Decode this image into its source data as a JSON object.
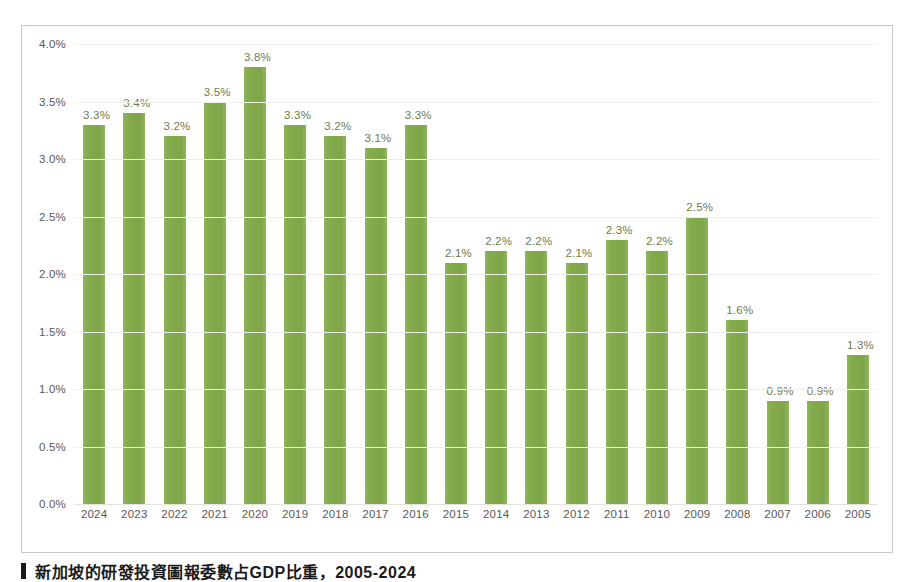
{
  "caption": {
    "bullet": "square-bullet-icon",
    "text": "新加坡的研發投資圖報委數占GDP比重，2005-2024"
  },
  "colors": {
    "bar": "#83ac4b",
    "bar_label": "#6f7a4d",
    "axis_text": "#585858",
    "frame": "#c9c9c9",
    "gridline": "#f0efe9"
  },
  "chart_data": {
    "type": "bar",
    "title": "",
    "xlabel": "",
    "ylabel": "",
    "ylim": [
      0,
      4.0
    ],
    "y_ticks": [
      "0.0%",
      "0.5%",
      "1.0%",
      "1.5%",
      "2.0%",
      "2.5%",
      "3.0%",
      "3.5%",
      "4.0%"
    ],
    "y_tick_values": [
      0,
      0.5,
      1.0,
      1.5,
      2.0,
      2.5,
      3.0,
      3.5,
      4.0
    ],
    "grid": true,
    "legend": "none",
    "categories": [
      "2024",
      "2023",
      "2022",
      "2021",
      "2020",
      "2019",
      "2018",
      "2017",
      "2016",
      "2015",
      "2014",
      "2013",
      "2012",
      "2011",
      "2010",
      "2009",
      "2008",
      "2007",
      "2006",
      "2005"
    ],
    "values": [
      3.3,
      3.4,
      3.2,
      3.5,
      3.8,
      3.3,
      3.2,
      3.1,
      3.3,
      2.1,
      2.2,
      2.2,
      2.1,
      2.3,
      2.2,
      2.5,
      1.6,
      0.9,
      0.9,
      1.3
    ],
    "data_labels": [
      "3.3%",
      "3.4%",
      "3.2%",
      "3.5%",
      "3.8%",
      "3.3%",
      "3.2%",
      "3.1%",
      "3.3%",
      "2.1%",
      "2.2%",
      "2.2%",
      "2.1%",
      "2.3%",
      "2.2%",
      "2.5%",
      "1.6%",
      "0.9%",
      "0.9%",
      "1.3%"
    ]
  }
}
